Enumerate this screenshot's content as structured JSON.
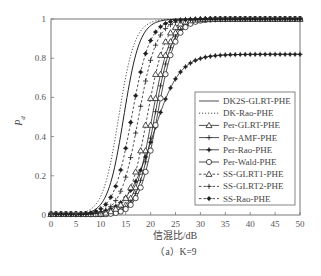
{
  "chart_data": {
    "type": "line",
    "title": "",
    "xlabel": "信混比/dB",
    "ylabel": "P_d",
    "ylabel_main": "P",
    "ylabel_sub": "d",
    "caption": "（a）K=9",
    "xlim": [
      0,
      50
    ],
    "ylim": [
      0,
      1
    ],
    "xticks": [
      0,
      5,
      10,
      15,
      20,
      25,
      30,
      35,
      40,
      45,
      50
    ],
    "xtick_labels": [
      "0",
      "5",
      "10",
      "15",
      "20",
      "25",
      "30",
      "35",
      "40",
      "45",
      "50"
    ],
    "yticks": [
      0,
      0.2,
      0.4,
      0.6,
      0.8,
      1
    ],
    "ytick_labels": [
      "0",
      "0.2",
      "0.4",
      "0.6",
      "0.8",
      "1"
    ],
    "grid": false,
    "legend_position": "lower-right",
    "x": [
      0,
      1,
      2,
      3,
      4,
      5,
      6,
      7,
      8,
      9,
      10,
      11,
      12,
      13,
      14,
      15,
      16,
      17,
      18,
      19,
      20,
      21,
      22,
      23,
      24,
      25,
      26,
      27,
      28,
      29,
      30,
      31,
      32,
      33,
      34,
      35,
      36,
      37,
      38,
      39,
      40,
      41,
      42,
      43,
      44,
      45,
      46,
      47,
      48,
      49,
      50
    ],
    "series": [
      {
        "name": "DK2S-GLRT-PHE",
        "line": "solid",
        "marker": "none",
        "midpoint_db": 14.6,
        "slope": 0.62,
        "plateau": 1.0
      },
      {
        "name": "DK-Rao-PHE",
        "line": "dotted",
        "marker": "none",
        "midpoint_db": 13.6,
        "slope": 0.62,
        "plateau": 1.0
      },
      {
        "name": "Per-GLRT-PHE",
        "line": "solid",
        "marker": "triangle",
        "midpoint_db": 20.3,
        "slope": 0.55,
        "plateau": 1.0
      },
      {
        "name": "Per-AMF-PHE",
        "line": "solid",
        "marker": "plus",
        "midpoint_db": 20.8,
        "slope": 0.55,
        "plateau": 1.0
      },
      {
        "name": "Per-Rao-PHE",
        "line": "solid",
        "marker": "dot",
        "midpoint_db": 20.5,
        "slope": 0.38,
        "plateau": 0.82
      },
      {
        "name": "Per-Wald-PHE",
        "line": "solid",
        "marker": "circle",
        "midpoint_db": 21.3,
        "slope": 0.55,
        "plateau": 1.0
      },
      {
        "name": "SS-GLRT1-PHE",
        "line": "dashed",
        "marker": "triangle",
        "midpoint_db": 19.3,
        "slope": 0.55,
        "plateau": 1.0
      },
      {
        "name": "SS-GLRT2-PHE",
        "line": "dashed",
        "marker": "plus",
        "midpoint_db": 17.6,
        "slope": 0.55,
        "plateau": 1.0
      },
      {
        "name": "SS-Rao-PHE",
        "line": "dashed",
        "marker": "star",
        "midpoint_db": 16.2,
        "slope": 0.55,
        "plateau": 1.0
      }
    ]
  }
}
